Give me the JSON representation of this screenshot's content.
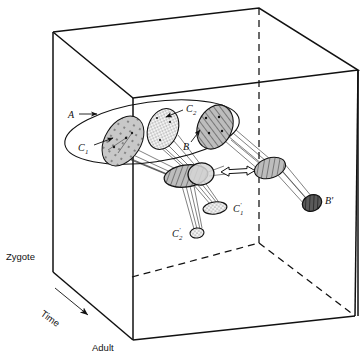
{
  "figure": {
    "type": "developmental-landscape-3d-diagram",
    "caption_labels": {
      "a": "A",
      "b": "B",
      "b_prime": "B'",
      "c1": "C",
      "c1_sub": "1",
      "c2": "C",
      "c2_sub": "2",
      "c1_prime": "C",
      "c1_prime_sub": "1",
      "c1_prime_mark": "'",
      "c2_prime": "C",
      "c2_prime_sub": "2",
      "c2_prime_mark": "'"
    },
    "axes": {
      "top_label": "Zygote",
      "bottom_label": "Adult",
      "time_label": "Time"
    },
    "colors": {
      "stroke": "#111111",
      "background": "#ffffff",
      "fill_light_gray": "#c9c9c9",
      "fill_mid_gray": "#b0b0b0",
      "fill_dark_gray": "#8a8a8a",
      "fill_stipple_bg": "#f2f2f2",
      "dashed_edge": "#111111",
      "arrow_outline": "#111111"
    },
    "regions": [
      {
        "name": "A",
        "shape": "large-ellipse-outline",
        "fill": "none",
        "cx": 152,
        "cy": 132,
        "rx": 88,
        "ry": 30,
        "rot": -8
      },
      {
        "name": "C1",
        "shape": "ellipse",
        "fill": "light-gray-with-dots",
        "cx": 123,
        "cy": 141,
        "rx": 27,
        "ry": 18,
        "rot": -58
      },
      {
        "name": "C2",
        "shape": "ellipse",
        "fill": "stipple",
        "cx": 163,
        "cy": 129,
        "rx": 21,
        "ry": 15,
        "rot": -70
      },
      {
        "name": "B",
        "shape": "ellipse",
        "fill": "hatch-gray",
        "cx": 215,
        "cy": 127,
        "rx": 23,
        "ry": 17,
        "rot": -65
      },
      {
        "name": "C1-mid",
        "shape": "ellipse",
        "fill": "hatch-gray",
        "cx": 186,
        "cy": 176,
        "rx": 22,
        "ry": 11,
        "rot": -8
      },
      {
        "name": "C2-mid",
        "shape": "ellipse",
        "fill": "light-gray",
        "cx": 200,
        "cy": 174,
        "rx": 13,
        "ry": 11,
        "rot": -8
      },
      {
        "name": "B-mid",
        "shape": "ellipse",
        "fill": "hatch-gray",
        "cx": 270,
        "cy": 168,
        "rx": 16,
        "ry": 10,
        "rot": -18
      },
      {
        "name": "B-prime",
        "shape": "ellipse",
        "fill": "hatch-dark",
        "cx": 312,
        "cy": 203,
        "rx": 10,
        "ry": 8,
        "rot": -25
      },
      {
        "name": "C1-prime",
        "shape": "ellipse",
        "fill": "stipple",
        "cx": 215,
        "cy": 208,
        "rx": 12,
        "ry": 6,
        "rot": -8
      },
      {
        "name": "C2-prime",
        "shape": "ellipse",
        "fill": "stipple",
        "cx": 197,
        "cy": 233,
        "rx": 7,
        "ry": 5,
        "rot": -8
      }
    ],
    "double_arrow": {
      "name": "equivalence-arrow",
      "from_x": 221,
      "from_y": 172,
      "to_x": 255,
      "to_y": 169
    }
  }
}
